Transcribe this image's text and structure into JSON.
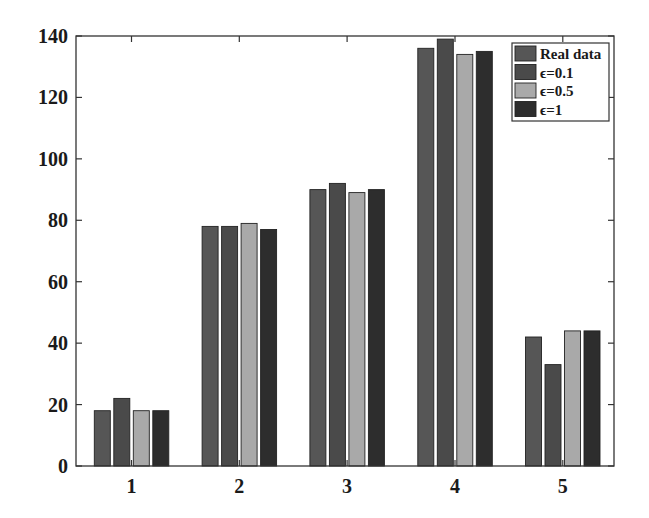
{
  "chart_data": {
    "type": "bar",
    "title": "",
    "xlabel": "",
    "ylabel": "",
    "categories": [
      "1",
      "2",
      "3",
      "4",
      "5"
    ],
    "series": [
      {
        "name": "Real data",
        "color": "#565656",
        "values": [
          18,
          78,
          90,
          136,
          42
        ]
      },
      {
        "name": "ϵ=0.1",
        "color": "#4a4a4a",
        "values": [
          22,
          78,
          92,
          139,
          33
        ]
      },
      {
        "name": "ϵ=0.5",
        "color": "#a9a9a9",
        "values": [
          18,
          79,
          89,
          134,
          44
        ]
      },
      {
        "name": "ϵ=1",
        "color": "#2d2d2d",
        "values": [
          18,
          77,
          90,
          135,
          44
        ]
      }
    ],
    "ylim": [
      0,
      140
    ],
    "yticks": [
      0,
      20,
      40,
      60,
      80,
      100,
      120,
      140
    ],
    "grid": false,
    "legend_position": "upper right"
  }
}
